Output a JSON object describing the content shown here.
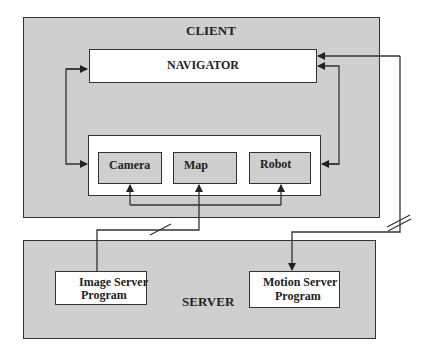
{
  "client": {
    "title": "CLIENT",
    "navigator": "NAVIGATOR",
    "modules": [
      "Camera",
      "Map",
      "Robot"
    ]
  },
  "server": {
    "title": "SERVER",
    "image_server": [
      "Image Server",
      "Program"
    ],
    "motion_server": [
      "Motion Server",
      "Program"
    ]
  },
  "colors": {
    "panel_gray": "#cfcfcf",
    "line": "#333333",
    "box_white": "#ffffff"
  }
}
